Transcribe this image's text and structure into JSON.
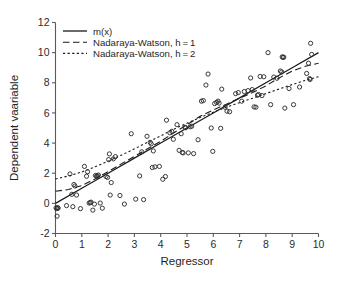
{
  "chart_data": {
    "type": "scatter",
    "title": "",
    "xlabel": "Regressor",
    "ylabel": "Dependent vaariable",
    "xlim": [
      0,
      10
    ],
    "ylim": [
      -2,
      12
    ],
    "xticks": [
      0,
      1,
      2,
      3,
      4,
      5,
      6,
      7,
      8,
      9,
      10
    ],
    "yticks": [
      -2,
      0,
      2,
      4,
      6,
      8,
      10,
      12
    ],
    "xtick_labels": [
      "0",
      "1",
      "2",
      "3",
      "4",
      "5",
      "6",
      "7",
      "8",
      "9",
      "10"
    ],
    "ytick_labels": [
      "-2",
      "0",
      "2",
      "4",
      "6",
      "8",
      "10",
      "12"
    ],
    "grid": false,
    "legend_position": "upper-left",
    "marker": "open-circle",
    "marker_color": "#2e2e2e",
    "line_color": "#1a1a1a",
    "legend": [
      {
        "label": "m(x)",
        "style": "solid"
      },
      {
        "label": "Nadaraya-Watson, h = 1",
        "style": "dashed"
      },
      {
        "label": "Nadaraya-Watson, h = 2",
        "style": "dotted"
      }
    ],
    "scatter": [
      [
        0.02,
        -0.3
      ],
      [
        0.05,
        -0.35
      ],
      [
        0.06,
        -0.85
      ],
      [
        0.08,
        -0.28
      ],
      [
        0.1,
        -0.32
      ],
      [
        0.42,
        -0.15
      ],
      [
        0.55,
        1.95
      ],
      [
        0.62,
        0.6
      ],
      [
        0.66,
        -0.22
      ],
      [
        0.7,
        1.25
      ],
      [
        0.74,
        1.15
      ],
      [
        0.8,
        0.55
      ],
      [
        0.95,
        -0.35
      ],
      [
        1.1,
        2.45
      ],
      [
        1.18,
        1.8
      ],
      [
        1.22,
        2.1
      ],
      [
        1.28,
        0.02
      ],
      [
        1.32,
        0.05
      ],
      [
        1.35,
        0.08
      ],
      [
        1.42,
        -0.45
      ],
      [
        1.48,
        -0.05
      ],
      [
        1.52,
        1.85
      ],
      [
        1.56,
        1.8
      ],
      [
        1.6,
        1.82
      ],
      [
        1.63,
        1.88
      ],
      [
        1.7,
        0.02
      ],
      [
        1.78,
        -0.32
      ],
      [
        1.92,
        1.78
      ],
      [
        1.98,
        1.72
      ],
      [
        2.02,
        2.9
      ],
      [
        2.05,
        3.28
      ],
      [
        2.08,
        0.55
      ],
      [
        2.12,
        1.38
      ],
      [
        2.2,
        2.95
      ],
      [
        2.28,
        3.1
      ],
      [
        2.45,
        0.52
      ],
      [
        2.62,
        -0.05
      ],
      [
        2.88,
        4.62
      ],
      [
        3.05,
        0.28
      ],
      [
        3.2,
        1.82
      ],
      [
        3.28,
        3.42
      ],
      [
        3.35,
        0.25
      ],
      [
        3.48,
        4.45
      ],
      [
        3.6,
        4.05
      ],
      [
        3.64,
        3.95
      ],
      [
        3.68,
        2.38
      ],
      [
        3.72,
        3.48
      ],
      [
        3.78,
        2.42
      ],
      [
        3.95,
        2.45
      ],
      [
        4.08,
        1.6
      ],
      [
        4.18,
        1.78
      ],
      [
        4.22,
        5.52
      ],
      [
        4.35,
        4.68
      ],
      [
        4.42,
        4.78
      ],
      [
        4.48,
        4.25
      ],
      [
        4.62,
        5.22
      ],
      [
        4.7,
        3.52
      ],
      [
        4.78,
        4.62
      ],
      [
        4.82,
        3.38
      ],
      [
        4.85,
        3.35
      ],
      [
        4.92,
        5.05
      ],
      [
        4.95,
        5.02
      ],
      [
        5.05,
        3.35
      ],
      [
        5.12,
        5.08
      ],
      [
        5.18,
        5.12
      ],
      [
        5.25,
        3.3
      ],
      [
        5.42,
        4.22
      ],
      [
        5.55,
        6.78
      ],
      [
        5.62,
        6.82
      ],
      [
        5.72,
        7.85
      ],
      [
        5.8,
        8.58
      ],
      [
        5.92,
        5.0
      ],
      [
        5.98,
        3.45
      ],
      [
        6.05,
        6.62
      ],
      [
        6.12,
        6.7
      ],
      [
        6.18,
        6.78
      ],
      [
        6.22,
        6.65
      ],
      [
        6.28,
        4.98
      ],
      [
        6.32,
        7.58
      ],
      [
        6.45,
        6.38
      ],
      [
        6.52,
        6.12
      ],
      [
        6.62,
        6.08
      ],
      [
        6.85,
        7.28
      ],
      [
        6.95,
        7.35
      ],
      [
        7.08,
        6.78
      ],
      [
        7.18,
        7.42
      ],
      [
        7.32,
        7.48
      ],
      [
        7.42,
        8.32
      ],
      [
        7.48,
        7.55
      ],
      [
        7.55,
        6.4
      ],
      [
        7.62,
        6.38
      ],
      [
        7.68,
        7.18
      ],
      [
        7.72,
        7.22
      ],
      [
        7.78,
        8.42
      ],
      [
        7.85,
        7.15
      ],
      [
        7.92,
        8.4
      ],
      [
        8.08,
        10.0
      ],
      [
        8.18,
        6.55
      ],
      [
        8.3,
        8.38
      ],
      [
        8.42,
        8.3
      ],
      [
        8.55,
        8.78
      ],
      [
        8.6,
        8.72
      ],
      [
        8.62,
        9.72
      ],
      [
        8.65,
        9.68
      ],
      [
        8.68,
        9.7
      ],
      [
        8.72,
        6.32
      ],
      [
        8.88,
        7.62
      ],
      [
        9.05,
        6.55
      ],
      [
        9.28,
        7.72
      ],
      [
        9.55,
        8.62
      ],
      [
        9.62,
        9.3
      ],
      [
        9.66,
        8.28
      ],
      [
        9.68,
        8.22
      ],
      [
        9.7,
        10.62
      ],
      [
        9.74,
        9.88
      ]
    ],
    "series": [
      {
        "name": "m(x)",
        "style": "solid",
        "x": [
          0.0,
          1.0,
          2.0,
          3.0,
          4.0,
          5.0,
          6.0,
          7.0,
          8.0,
          9.0,
          10.0
        ],
        "values": [
          0.0,
          1.0,
          2.0,
          3.0,
          4.0,
          5.0,
          6.0,
          7.0,
          8.0,
          9.0,
          10.0
        ]
      },
      {
        "name": "Nadaraya-Watson, h = 1",
        "style": "dashed",
        "x": [
          0.0,
          0.5,
          1.0,
          1.5,
          2.0,
          2.5,
          3.0,
          3.5,
          4.0,
          4.5,
          5.0,
          5.5,
          6.0,
          6.5,
          7.0,
          7.5,
          8.0,
          8.5,
          9.0,
          9.5,
          10.0
        ],
        "values": [
          0.8,
          0.92,
          1.18,
          1.62,
          2.1,
          2.62,
          3.12,
          3.62,
          4.12,
          4.68,
          5.22,
          5.78,
          6.2,
          6.58,
          6.98,
          7.35,
          7.8,
          8.32,
          8.78,
          9.1,
          9.3
        ]
      },
      {
        "name": "Nadaraya-Watson, h = 2",
        "style": "dotted",
        "x": [
          0.0,
          0.5,
          1.0,
          1.5,
          2.0,
          2.5,
          3.0,
          3.5,
          4.0,
          4.5,
          5.0,
          5.5,
          6.0,
          6.5,
          7.0,
          7.5,
          8.0,
          8.5,
          9.0,
          9.5,
          10.0
        ],
        "values": [
          1.62,
          1.82,
          2.08,
          2.42,
          2.8,
          3.2,
          3.62,
          4.05,
          4.48,
          4.92,
          5.32,
          5.7,
          6.05,
          6.38,
          6.68,
          6.98,
          7.28,
          7.58,
          7.88,
          8.16,
          8.4
        ]
      }
    ]
  },
  "axes": {
    "x_title": "Regressor",
    "y_title": "Dependent vaariable"
  },
  "legend": {
    "items": [
      {
        "label": "m(x)"
      },
      {
        "label": "Nadaraya-Watson, h = 1"
      },
      {
        "label": "Nadaraya-Watson, h = 2"
      }
    ]
  },
  "colors": {
    "line": "#1a1a1a",
    "marker": "#2e2e2e",
    "axis": "#5b5b5b",
    "background": "#ffffff"
  }
}
